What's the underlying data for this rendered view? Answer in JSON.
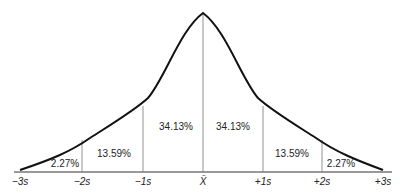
{
  "diagram": {
    "type": "normal-distribution-curve",
    "areas": [
      {
        "label": "2.27%",
        "region": "-3s to -2s"
      },
      {
        "label": "13.59%",
        "region": "-2s to -1s"
      },
      {
        "label": "34.13%",
        "region": "-1s to mean"
      },
      {
        "label": "34.13%",
        "region": "mean to +1s"
      },
      {
        "label": "13.59%",
        "region": "+1s to +2s"
      },
      {
        "label": "2.27%",
        "region": "+2s to +3s"
      }
    ],
    "axis_ticks": [
      "−3s",
      "−2s",
      "−1s",
      "X̄",
      "+1s",
      "+2s",
      "+3s"
    ],
    "colors": {
      "curve": "#111111",
      "lines": "#777777",
      "text": "#222222"
    }
  }
}
